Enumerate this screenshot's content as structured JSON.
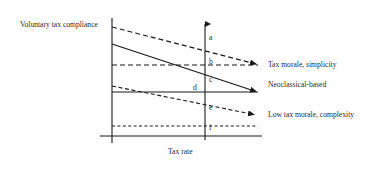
{
  "figure": {
    "type": "line-diagram",
    "axes": {
      "y_axis_label": "Voluntary tax compliance",
      "x_axis_label": "Tax rate",
      "vertical_boundary_x": 112,
      "horizontal_baseline_y": 136,
      "center_axis_x": 205
    },
    "axis_letters": [
      {
        "id": "a",
        "label": "a",
        "x": 209,
        "y": 34
      },
      {
        "id": "b",
        "label": "b",
        "x": 209,
        "y": 58
      },
      {
        "id": "c",
        "label": "c",
        "x": 209,
        "y": 76
      },
      {
        "id": "d",
        "label": "d",
        "x": 193,
        "y": 84
      },
      {
        "id": "e",
        "label": "e",
        "x": 209,
        "y": 104
      },
      {
        "id": "f",
        "label": "f",
        "x": 209,
        "y": 124
      }
    ],
    "curves": [
      {
        "id": "tax-morale-simplicity",
        "label": "Tax morale, simplicity",
        "style": "dashed",
        "start": {
          "x": 112,
          "y": 27
        },
        "end": {
          "x": 262,
          "y": 65
        },
        "label_x": 268,
        "label_y": 61
      },
      {
        "id": "neoclassical-based",
        "label": "Neoclassical-based",
        "style": "solid",
        "start": {
          "x": 112,
          "y": 44
        },
        "end": {
          "x": 262,
          "y": 92
        },
        "label_x": 268,
        "label_y": 81
      },
      {
        "id": "low-tax-morale-complexity",
        "label": "Low tax morale, complexity",
        "style": "dashed",
        "start": {
          "x": 112,
          "y": 86
        },
        "end": {
          "x": 262,
          "y": 115
        },
        "label_x": 268,
        "label_y": 111
      }
    ],
    "reference_lines": [
      {
        "id": "ref-b",
        "style": "dashed",
        "y": 65,
        "x1": 112,
        "x2": 262
      },
      {
        "id": "ref-d",
        "style": "solid",
        "y": 92,
        "x1": 112,
        "x2": 262
      },
      {
        "id": "ref-f",
        "style": "dashed",
        "y": 126,
        "x1": 112,
        "x2": 262
      }
    ],
    "colors": {
      "ink": "#1a1a1a",
      "background": "#ffffff"
    }
  }
}
